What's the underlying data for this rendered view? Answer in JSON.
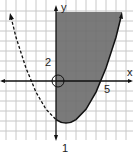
{
  "graph": {
    "type": "parabola-inequality",
    "axes": {
      "x_label": "x",
      "y_label": "y"
    },
    "tick_labels": {
      "y_tick": "2",
      "x_tick": "5"
    },
    "bottom_caption": "1",
    "grid_unit_px": 10,
    "origin_px": [
      56,
      81
    ],
    "parabola": {
      "vertex_units": [
        1,
        -4.2
      ],
      "x_intercepts_units": [
        -2.4,
        4.5
      ],
      "left_branch_style": "dashed",
      "right_branch_style": "solid"
    },
    "shaded_region": "x >= 0 and above parabola",
    "colors": {
      "shade": "#6b6b6b",
      "grid": "#c8c8c8",
      "axis": "#111111",
      "curve": "#111111"
    }
  }
}
